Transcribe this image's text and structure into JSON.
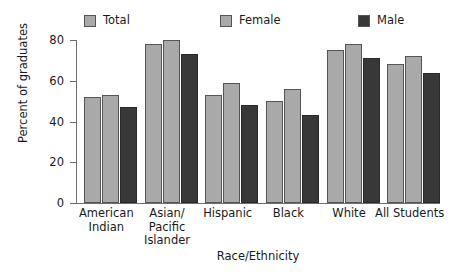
{
  "chart_data": {
    "type": "bar",
    "title": "",
    "xlabel": "Race/Ethnicity",
    "ylabel": "Percent of graduates",
    "ylim": [
      0,
      80
    ],
    "yticks": [
      0,
      20,
      40,
      60,
      80
    ],
    "grid": false,
    "legend_position": "top",
    "categories": [
      "American\nIndian",
      "Asian/\nPacific\nIslander",
      "Hispanic",
      "Black",
      "White",
      "All Students"
    ],
    "series": [
      {
        "name": "Total",
        "color": "#a9a9a9",
        "values": [
          52,
          78,
          53,
          50,
          75,
          68
        ]
      },
      {
        "name": "Female",
        "color": "#a9a9a9",
        "values": [
          53,
          80,
          59,
          56,
          78,
          72
        ]
      },
      {
        "name": "Male",
        "color": "#383838",
        "values": [
          47,
          73,
          48,
          43,
          71,
          64
        ]
      }
    ]
  },
  "legend": {
    "items": [
      {
        "label": "Total",
        "swatch": "#a9a9a9"
      },
      {
        "label": "Female",
        "swatch": "#a9a9a9"
      },
      {
        "label": "Male",
        "swatch": "#383838"
      }
    ]
  },
  "axes": {
    "y_tick_labels": [
      "80",
      "60",
      "40",
      "20",
      "0"
    ],
    "y_axis_title": "Percent of graduates",
    "x_axis_title": "Race/Ethnicity",
    "x_tick_labels": [
      "American\nIndian",
      "Asian/\nPacific\nIslander",
      "Hispanic",
      "Black",
      "White",
      "All Students"
    ]
  }
}
